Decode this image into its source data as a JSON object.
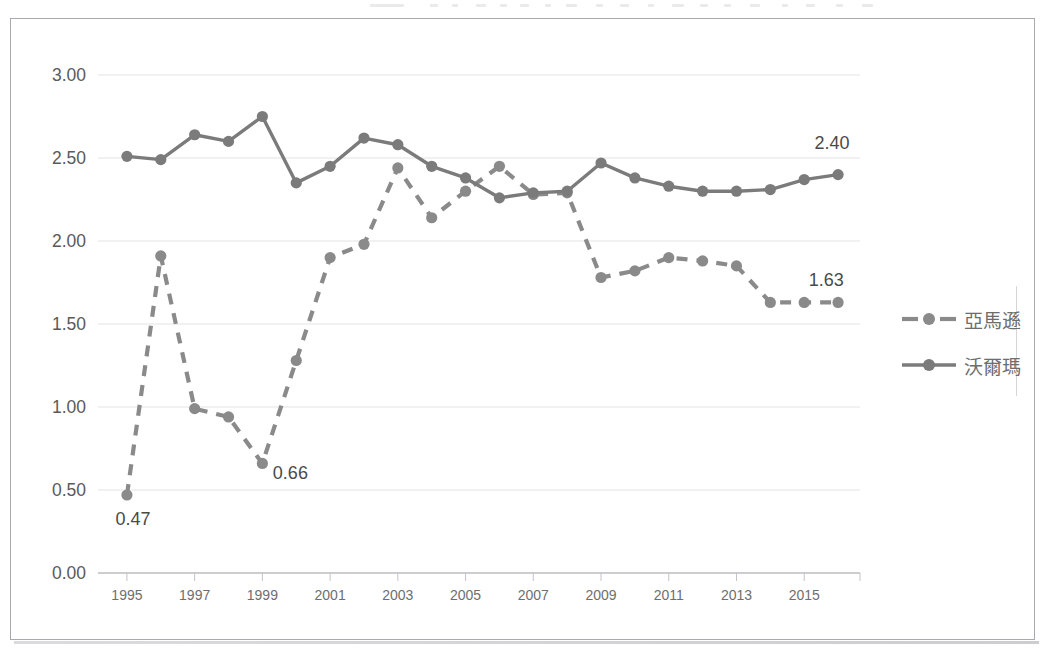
{
  "chart_data": {
    "type": "line",
    "title": "",
    "xlabel": "",
    "ylabel": "",
    "x": [
      1995,
      1996,
      1997,
      1998,
      1999,
      2000,
      2001,
      2002,
      2003,
      2004,
      2005,
      2006,
      2007,
      2008,
      2009,
      2010,
      2011,
      2012,
      2013,
      2014,
      2015,
      2016
    ],
    "xlim": [
      1994.5,
      2016.5
    ],
    "ylim": [
      0.0,
      3.0
    ],
    "ytick_labels": [
      "0.00",
      "0.50",
      "1.00",
      "1.50",
      "2.00",
      "2.50",
      "3.00"
    ],
    "ytick_values": [
      0.0,
      0.5,
      1.0,
      1.5,
      2.0,
      2.5,
      3.0
    ],
    "xtick_labels": [
      "1995",
      "1997",
      "1999",
      "2001",
      "2003",
      "2005",
      "2007",
      "2009",
      "2011",
      "2013",
      "2015"
    ],
    "xtick_values": [
      1995,
      1997,
      1999,
      2001,
      2003,
      2005,
      2007,
      2009,
      2011,
      2013,
      2015
    ],
    "grid": true,
    "legend_position": "right",
    "series": [
      {
        "name": "亞馬遜",
        "style": "dashed",
        "color": "#8a8a8a",
        "values": [
          0.47,
          1.91,
          0.99,
          0.94,
          0.66,
          1.28,
          1.9,
          1.98,
          2.44,
          2.14,
          2.3,
          2.45,
          2.28,
          2.29,
          1.78,
          1.82,
          1.9,
          1.88,
          1.85,
          1.63,
          1.63,
          1.63
        ]
      },
      {
        "name": "沃爾瑪",
        "style": "solid",
        "color": "#7b7b7b",
        "values": [
          2.51,
          2.49,
          2.64,
          2.6,
          2.75,
          2.35,
          2.45,
          2.62,
          2.58,
          2.45,
          2.38,
          2.26,
          2.29,
          2.3,
          2.47,
          2.38,
          2.33,
          2.3,
          2.3,
          2.31,
          2.37,
          2.4
        ]
      }
    ],
    "annotations": [
      {
        "text": "0.47",
        "x": 1995,
        "y": 0.47,
        "placement": "below"
      },
      {
        "text": "0.66",
        "x": 1999,
        "y": 0.66,
        "placement": "below-right"
      },
      {
        "text": "1.63",
        "x": 2015,
        "y": 1.63,
        "placement": "above"
      },
      {
        "text": "2.40",
        "x": 2016,
        "y": 2.4,
        "placement": "above-left"
      }
    ]
  },
  "legend": {
    "items": [
      {
        "label": "亞馬遜",
        "style": "dashed"
      },
      {
        "label": "沃爾瑪",
        "style": "solid"
      }
    ]
  },
  "colors": {
    "amazon": "#8a8a8a",
    "walmart": "#7b7b7b",
    "grid": "#e3e3e6",
    "axis": "#bdbdc1",
    "frame": "#a9a9ad",
    "label_text": "#5a5a5a",
    "tick_text": "#6e6e6e"
  }
}
